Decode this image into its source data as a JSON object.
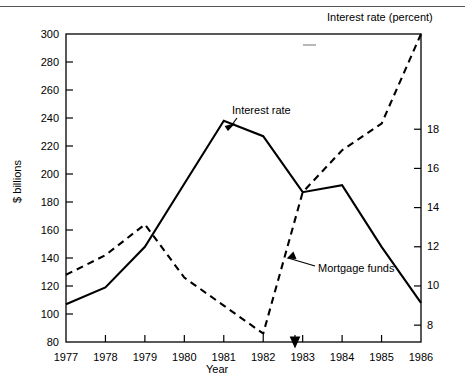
{
  "figure": {
    "right_axis_title": "Interest rate (percent)",
    "left_axis_title": "$ billions",
    "x_axis_title": "Year",
    "annotations": [
      {
        "name": "interest-rate",
        "text": "Interest rate"
      },
      {
        "name": "mortgage-funds",
        "text": "Mortgage funds"
      }
    ]
  },
  "chart_data": {
    "type": "line",
    "title": "",
    "xlabel": "Year",
    "ylabel": "$ billions",
    "y2label": "Interest rate (percent)",
    "x": [
      1977,
      1978,
      1979,
      1980,
      1981,
      1982,
      1983,
      1984,
      1985,
      1986
    ],
    "xtick_labels": [
      "1977",
      "1978",
      "1979",
      "1980",
      "1981",
      "1982",
      "1983",
      "1984",
      "1985",
      "1986"
    ],
    "ylim": [
      80,
      300
    ],
    "ytick_labels": [
      "80",
      "100",
      "120",
      "140",
      "160",
      "180",
      "200",
      "220",
      "240",
      "260",
      "280",
      "300"
    ],
    "yticks": [
      80,
      100,
      120,
      140,
      160,
      180,
      200,
      220,
      240,
      260,
      280,
      300
    ],
    "y2lim": [
      7.14,
      22.86
    ],
    "y2ticks": [
      8,
      10,
      12,
      14,
      16,
      18
    ],
    "y2tick_labels": [
      "8",
      "10",
      "12",
      "14",
      "16",
      "18"
    ],
    "grid": false,
    "legend": "annotations-with-arrows",
    "series": [
      {
        "name": "Interest rate",
        "style": "solid",
        "axis": "right",
        "color": "#000000",
        "values_left_scale": [
          107,
          119,
          148,
          193,
          238,
          227,
          187,
          192,
          148,
          108
        ],
        "values": [
          9.4,
          10.2,
          12.3,
          15.5,
          18.7,
          17.9,
          15.1,
          15.5,
          12.3,
          10.0
        ]
      },
      {
        "name": "Mortgage funds",
        "style": "dashed",
        "axis": "left",
        "color": "#000000",
        "values": [
          128,
          142,
          164,
          126,
          106,
          86,
          187,
          217,
          236,
          300
        ]
      }
    ]
  }
}
